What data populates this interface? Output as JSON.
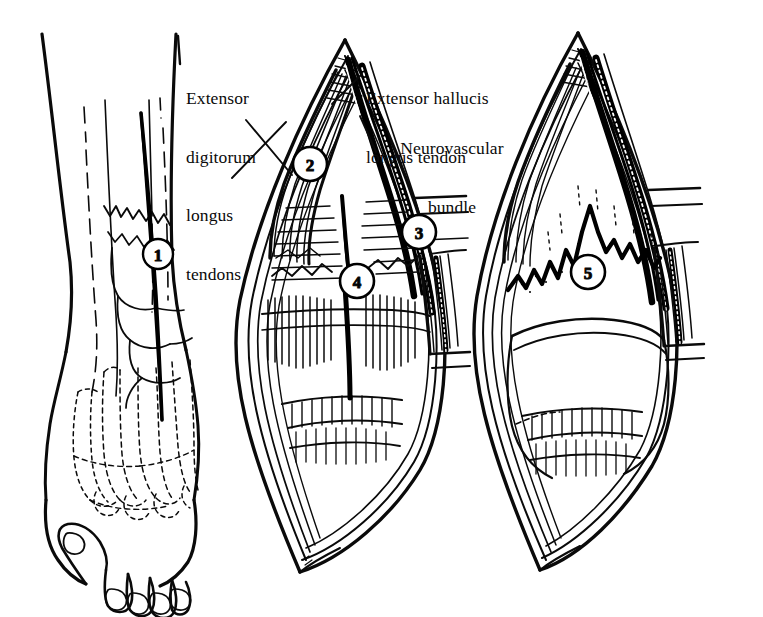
{
  "figure": {
    "background_color": "#ffffff",
    "ink_color": "#0a0a0a",
    "style": "pen-and-ink medical illustration, black line art on white"
  },
  "labels": [
    {
      "id": "extensor-digitorum-longus-tendons",
      "text": "Extensor\ndigitorum\nlongus\ntendons",
      "lines": [
        "Extensor",
        "digitorum",
        "longus",
        "tendons"
      ],
      "x": 186,
      "y": 50,
      "align": "left",
      "leader_to": [
        277,
        155
      ]
    },
    {
      "id": "extensor-hallucis-longus-tendon",
      "text": "Extensor hallucis\nlongus tendon",
      "lines": [
        "Extensor hallucis",
        "longus tendon"
      ],
      "x": 366,
      "y": 50,
      "align": "left",
      "leader_to": [
        342,
        75
      ]
    },
    {
      "id": "neurovascular-bundle",
      "text": "Neurovascular\nbundle",
      "lines": [
        "Neurovascular",
        "bundle"
      ],
      "x": 366,
      "y": 100,
      "align": "left",
      "leader_to": [
        372,
        140
      ]
    }
  ],
  "callouts": [
    {
      "number": "1",
      "cx": 158,
      "cy": 254,
      "r": 15,
      "panel": "foot-overview",
      "meaning": "skin incision line"
    },
    {
      "number": "2",
      "cx": 310,
      "cy": 164,
      "r": 17,
      "panel": "exposure",
      "meaning": "extensor digitorum longus tendons retracted"
    },
    {
      "number": "3",
      "cx": 419,
      "cy": 232,
      "r": 17,
      "panel": "exposure",
      "meaning": "neurovascular bundle retracted laterally"
    },
    {
      "number": "4",
      "cx": 357,
      "cy": 281,
      "r": 17,
      "panel": "exposure",
      "meaning": "deep fascia / capsule incised"
    },
    {
      "number": "5",
      "cx": 588,
      "cy": 272,
      "r": 17,
      "panel": "deep-dissection",
      "meaning": "periosteum elevated exposing bone"
    }
  ],
  "panels": [
    {
      "id": "foot-overview",
      "name": "Dorsal view of foot and ankle with incision",
      "x": 20,
      "y": 30,
      "w": 195,
      "h": 560
    },
    {
      "id": "exposure",
      "name": "Superficial exposure of tendons and bundle",
      "x": 220,
      "y": 35,
      "w": 245,
      "h": 545
    },
    {
      "id": "deep-dissection",
      "name": "Deep dissection to bone",
      "x": 468,
      "y": 30,
      "w": 265,
      "h": 545
    }
  ]
}
